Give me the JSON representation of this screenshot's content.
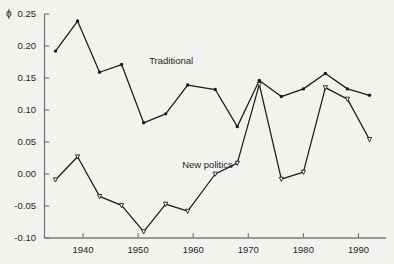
{
  "figure": {
    "background_color": "#f2f2ef",
    "line_color": "#1a1a1a",
    "axis_color": "#7a7a7a"
  },
  "chart_data": {
    "type": "line",
    "title": "",
    "xlabel": "",
    "ylabel": "ϕ",
    "ylim": [
      -0.1,
      0.25
    ],
    "xlim": [
      1933,
      1995
    ],
    "grid": false,
    "legend_position": "inline-annotation",
    "yticks": [
      0.25,
      0.2,
      0.15,
      0.1,
      0.05,
      0.0,
      -0.05,
      -0.1
    ],
    "ytick_labels": [
      "0.25",
      "0.20",
      "0.15",
      "0.10",
      "0.05",
      "0.00",
      "-0.05",
      "-0.10"
    ],
    "xticks": [
      1940,
      1950,
      1960,
      1970,
      1980,
      1990
    ],
    "xtick_labels": [
      "1940",
      "1950",
      "1960",
      "1970",
      "1980",
      "1990"
    ],
    "x": [
      1935,
      1939,
      1943,
      1947,
      1951,
      1955,
      1959,
      1964,
      1968,
      1972,
      1976,
      1980,
      1984,
      1988,
      1992
    ],
    "series": [
      {
        "name": "Traditional",
        "marker": "filled-circle",
        "values": [
          0.192,
          0.239,
          0.159,
          0.171,
          0.08,
          0.094,
          0.139,
          0.132,
          0.074,
          0.146,
          0.121,
          0.133,
          0.157,
          0.133,
          0.123
        ]
      },
      {
        "name": "New politics",
        "marker": "open-triangle",
        "values": [
          -0.009,
          0.027,
          -0.035,
          -0.049,
          -0.09,
          -0.047,
          -0.058,
          0.0,
          0.017,
          0.14,
          -0.008,
          0.003,
          0.135,
          0.117,
          0.054
        ]
      }
    ],
    "annotations": [
      {
        "text": "Traditional",
        "x": 1952,
        "y": 0.175
      },
      {
        "text": "New politics",
        "x": 1958,
        "y": 0.013
      }
    ]
  },
  "axis": {
    "phi_symbol": "ϕ"
  }
}
